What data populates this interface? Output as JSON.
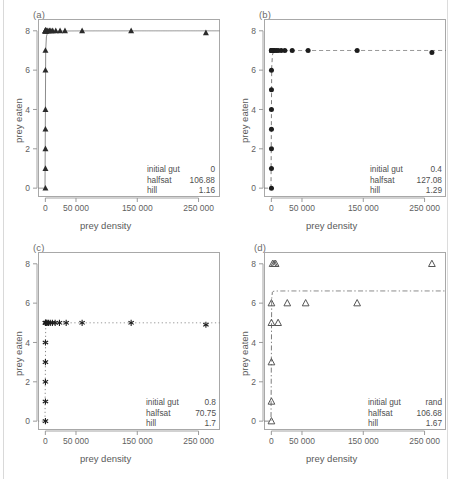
{
  "figure": {
    "axis_labels": {
      "x": "prey density",
      "y": "prey eaten"
    },
    "x_ticks": [
      "0",
      "50 000",
      "150 000",
      "250 000"
    ],
    "x_tick_values": [
      0,
      50000,
      150000,
      250000
    ],
    "y_ticks": [
      "0",
      "2",
      "4",
      "6",
      "8"
    ],
    "y_tick_values": [
      0,
      2,
      4,
      6,
      8
    ],
    "xlim": [
      -12000,
      285000
    ],
    "ylim": [
      -0.45,
      8.6
    ],
    "caption": "",
    "ann_keys": {
      "initial_gut": "initial gut",
      "halfsat": "halfsat",
      "hill": "hill"
    }
  },
  "chart_data": [
    {
      "panel": "(a)",
      "type": "scatter",
      "title": "",
      "xlabel": "prey density",
      "ylabel": "prey eaten",
      "xlim": [
        -12000,
        285000
      ],
      "ylim": [
        -0.45,
        8.6
      ],
      "grid": false,
      "marker": "filled-triangle",
      "marker_color": "#2b2b2b",
      "curve_style": "solid",
      "curve_color": "#8c8c8c",
      "asymptote": 8.0,
      "params": {
        "initial gut": "0",
        "halfsat": "106.88",
        "hill": "1.16"
      },
      "x": [
        30,
        60,
        90,
        120,
        180,
        260,
        400,
        700,
        1200,
        2600,
        4200,
        6800,
        9000,
        12000,
        17000,
        24000,
        32000,
        60000,
        140000,
        262000,
        150,
        150,
        150,
        150,
        150,
        150,
        150
      ],
      "y": [
        8,
        8,
        8,
        8,
        8,
        8,
        8,
        8,
        8,
        8,
        8,
        8,
        8,
        8,
        8,
        8,
        8,
        8,
        8,
        7.9,
        0,
        1,
        2,
        3,
        4,
        6,
        7
      ]
    },
    {
      "panel": "(b)",
      "type": "scatter",
      "title": "",
      "xlabel": "prey density",
      "ylabel": "prey eaten",
      "xlim": [
        -12000,
        285000
      ],
      "ylim": [
        -0.45,
        8.6
      ],
      "grid": false,
      "marker": "filled-circle",
      "marker_color": "#1d1d1d",
      "curve_style": "dashed",
      "curve_color": "#7d7d7d",
      "asymptote": 7.0,
      "params": {
        "initial gut": "0.4",
        "halfsat": "127.08",
        "hill": "1.29"
      },
      "x": [
        80,
        200,
        420,
        900,
        1800,
        3200,
        5200,
        8000,
        11000,
        16000,
        22000,
        34000,
        60000,
        140000,
        262000,
        150,
        150,
        150,
        150,
        150,
        150,
        150,
        150
      ],
      "y": [
        7,
        7,
        7,
        7,
        7,
        7,
        7,
        7,
        7,
        7,
        7,
        7,
        7,
        7,
        6.9,
        0,
        1,
        2,
        3,
        4,
        5,
        6,
        7
      ]
    },
    {
      "panel": "(c)",
      "type": "scatter",
      "title": "",
      "xlabel": "prey density",
      "ylabel": "prey eaten",
      "xlim": [
        -12000,
        285000
      ],
      "ylim": [
        -0.45,
        8.6
      ],
      "grid": false,
      "marker": "asterisk",
      "marker_color": "#1d1d1d",
      "curve_style": "dotted",
      "curve_color": "#8a8a8a",
      "asymptote": 5.0,
      "params": {
        "initial gut": "0.8",
        "halfsat": "70.75",
        "hill": "1.7"
      },
      "x": [
        80,
        240,
        600,
        1400,
        2800,
        5000,
        8000,
        11500,
        16000,
        23000,
        34000,
        60000,
        140000,
        262000,
        150,
        150,
        150,
        150,
        150
      ],
      "y": [
        5,
        5,
        5,
        5,
        5,
        5,
        5,
        5,
        5,
        5,
        5,
        5,
        5,
        4.9,
        0,
        1,
        2,
        3,
        4
      ]
    },
    {
      "panel": "(d)",
      "type": "scatter",
      "title": "",
      "xlabel": "prey density",
      "ylabel": "prey eaten",
      "xlim": [
        -12000,
        285000
      ],
      "ylim": [
        -0.45,
        8.6
      ],
      "grid": false,
      "marker": "open-triangle",
      "marker_color": "#555555",
      "curve_style": "dashdot",
      "curve_color": "#7d7d7d",
      "asymptote": 6.62,
      "params": {
        "initial gut": "rand",
        "halfsat": "106.68",
        "hill": "1.67"
      },
      "x": [
        2000,
        4500,
        7000,
        262000,
        150,
        26000,
        56000,
        140000,
        150,
        11000,
        150,
        150,
        150
      ],
      "y": [
        8,
        8,
        8,
        8,
        6,
        6,
        6,
        6,
        5,
        5,
        3,
        1,
        0
      ]
    }
  ]
}
